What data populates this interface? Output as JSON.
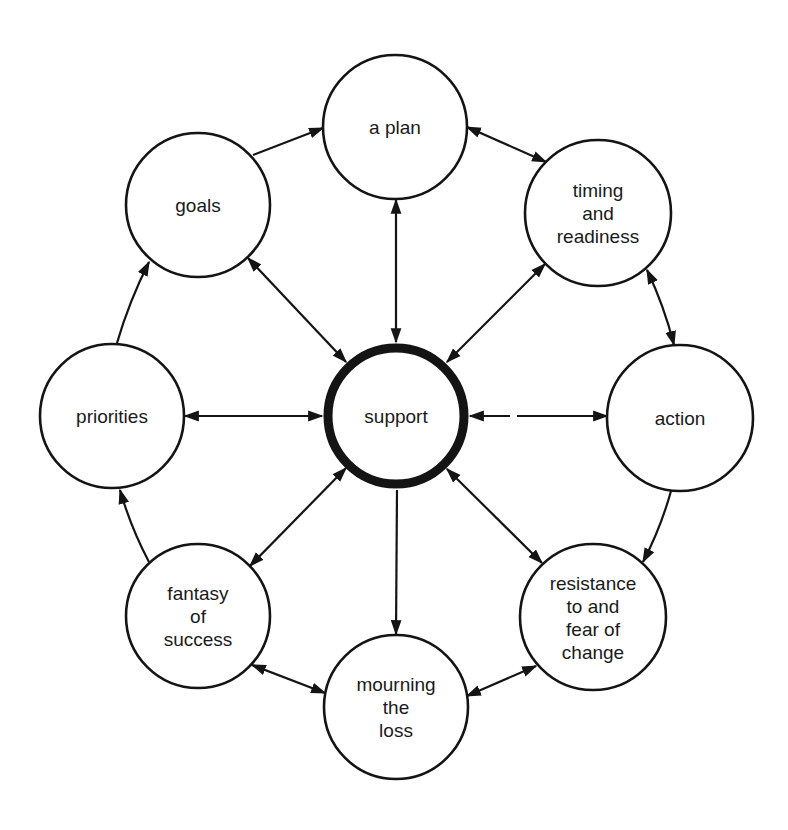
{
  "diagram": {
    "type": "hub-and-cycle",
    "center": {
      "id": "support",
      "label_lines": [
        "support"
      ],
      "x": 396,
      "y": 416,
      "r": 68
    },
    "nodes": [
      {
        "id": "a-plan",
        "label_lines": [
          "a plan"
        ],
        "x": 395,
        "y": 127,
        "r": 72
      },
      {
        "id": "timing-and-readiness",
        "label_lines": [
          "timing",
          "and",
          "readiness"
        ],
        "x": 598,
        "y": 213,
        "r": 73
      },
      {
        "id": "action",
        "label_lines": [
          "action"
        ],
        "x": 680,
        "y": 418,
        "r": 73
      },
      {
        "id": "resistance-to-and-fear-of-change",
        "label_lines": [
          "resistance",
          "to and",
          "fear of",
          "change"
        ],
        "x": 593,
        "y": 617,
        "r": 73
      },
      {
        "id": "mourning-the-loss",
        "label_lines": [
          "mourning",
          "the",
          "loss"
        ],
        "x": 396,
        "y": 707,
        "r": 72
      },
      {
        "id": "fantasy-of-success",
        "label_lines": [
          "fantasy",
          "of",
          "success"
        ],
        "x": 198,
        "y": 616,
        "r": 72
      },
      {
        "id": "priorities",
        "label_lines": [
          "priorities"
        ],
        "x": 112,
        "y": 416,
        "r": 72
      },
      {
        "id": "goals",
        "label_lines": [
          "goals"
        ],
        "x": 198,
        "y": 205,
        "r": 72
      }
    ],
    "cycle_edges": [
      {
        "from": "goals",
        "to": "a-plan",
        "x1": 253,
        "y1": 155,
        "x2": 323,
        "y2": 128,
        "bend": 0,
        "arrow_start": false,
        "arrow_end": true
      },
      {
        "from": "a-plan",
        "to": "timing-and-readiness",
        "x1": 467,
        "y1": 127,
        "x2": 546,
        "y2": 162,
        "bend": 0,
        "arrow_start": true,
        "arrow_end": true
      },
      {
        "from": "timing-and-readiness",
        "to": "action",
        "x1": 647,
        "y1": 270,
        "x2": 674,
        "y2": 345,
        "bend": -4,
        "arrow_start": true,
        "arrow_end": true
      },
      {
        "from": "action",
        "to": "resistance-to-and-fear-of-change",
        "x1": 671,
        "y1": 491,
        "x2": 643,
        "y2": 562,
        "bend": -4,
        "arrow_start": false,
        "arrow_end": true
      },
      {
        "from": "resistance-to-and-fear-of-change",
        "to": "mourning-the-loss",
        "x1": 536,
        "y1": 666,
        "x2": 467,
        "y2": 696,
        "bend": 0,
        "arrow_start": true,
        "arrow_end": true
      },
      {
        "from": "fantasy-of-success",
        "to": "mourning-the-loss",
        "x1": 252,
        "y1": 665,
        "x2": 325,
        "y2": 693,
        "bend": 0,
        "arrow_start": true,
        "arrow_end": true
      },
      {
        "from": "fantasy-of-success",
        "to": "priorities",
        "x1": 149,
        "y1": 562,
        "x2": 120,
        "y2": 490,
        "bend": -4,
        "arrow_start": false,
        "arrow_end": true
      },
      {
        "from": "priorities",
        "to": "goals",
        "x1": 117,
        "y1": 343,
        "x2": 149,
        "y2": 262,
        "bend": -4,
        "arrow_start": false,
        "arrow_end": true
      }
    ],
    "spoke_edges": [
      {
        "to": "a-plan",
        "x1": 396,
        "y1": 200,
        "x2": 396,
        "y2": 342,
        "arrow_start": true,
        "arrow_end": true,
        "gap": null
      },
      {
        "to": "timing-and-readiness",
        "x1": 545,
        "y1": 264,
        "x2": 447,
        "y2": 362,
        "arrow_start": true,
        "arrow_end": true,
        "gap": null
      },
      {
        "to": "action",
        "x1": 470,
        "y1": 416,
        "x2": 607,
        "y2": 416,
        "arrow_start": true,
        "arrow_end": true,
        "gap": [
          510,
          517
        ]
      },
      {
        "to": "resistance-to-and-fear-of-change",
        "x1": 447,
        "y1": 469,
        "x2": 542,
        "y2": 563,
        "arrow_start": true,
        "arrow_end": true,
        "gap": null
      },
      {
        "to": "mourning-the-loss",
        "x1": 397,
        "y1": 490,
        "x2": 396,
        "y2": 634,
        "arrow_start": false,
        "arrow_end": true,
        "gap": null
      },
      {
        "to": "fantasy-of-success",
        "x1": 346,
        "y1": 468,
        "x2": 250,
        "y2": 566,
        "arrow_start": true,
        "arrow_end": true,
        "gap": null
      },
      {
        "to": "priorities",
        "x1": 185,
        "y1": 416,
        "x2": 322,
        "y2": 416,
        "arrow_start": true,
        "arrow_end": true,
        "gap": null
      },
      {
        "to": "goals",
        "x1": 248,
        "y1": 258,
        "x2": 346,
        "y2": 362,
        "arrow_start": true,
        "arrow_end": true,
        "gap": null
      }
    ]
  },
  "colors": {
    "ink": "#141414",
    "text": "#1a1a1a",
    "background": "#ffffff"
  }
}
